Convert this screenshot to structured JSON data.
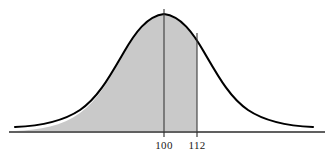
{
  "figure": {
    "type": "normal-distribution-curve",
    "background_color": "#ffffff",
    "curve_color": "#000000",
    "shade_color": "#c9c9c9",
    "axis_color": "#2b2b2b",
    "marker_line_color": "#3a3a3a"
  },
  "axis": {
    "baseline_y": 132,
    "x_start": 9,
    "x_end": 325
  },
  "markers": [
    {
      "id": "mean-marker",
      "label": "100",
      "x": 164,
      "label_x": 164,
      "label_y": 139,
      "line_top_y": 9,
      "tick_bottom_y": 137
    },
    {
      "id": "value-marker",
      "label": "112",
      "x": 197,
      "label_x": 197,
      "label_y": 139,
      "line_top_y": 33,
      "tick_bottom_y": 137
    }
  ],
  "chart_data": {
    "type": "area",
    "title": "",
    "subtitle": "",
    "xlabel": "",
    "ylabel": "",
    "grid": false,
    "legend": null,
    "distribution": "normal",
    "mean": 100,
    "std_dev": 12,
    "tick_labels": [
      "100",
      "112"
    ],
    "tick_values": [
      100,
      112
    ],
    "shaded_region": {
      "from": "-infinity",
      "to": 112,
      "fill": "#c9c9c9",
      "description": "Area under the normal curve to the left of 112"
    },
    "vertical_lines": [
      100,
      112
    ],
    "x_pixel_of_mean": 164,
    "x_pixel_per_unit": 2.75,
    "curve_peak_pixel": {
      "x": 164,
      "y": 14
    },
    "curve_extent_pixels": {
      "left": 15,
      "right": 313
    },
    "series": [
      {
        "name": "normal density",
        "x": [
          60,
          64,
          68,
          72,
          76,
          80,
          84,
          88,
          92,
          96,
          100,
          104,
          108,
          112,
          116,
          120,
          124,
          128,
          132,
          136,
          140
        ],
        "values": [
          0.0005,
          0.0014,
          0.0036,
          0.0082,
          0.0166,
          0.0301,
          0.0487,
          0.0704,
          0.0911,
          0.1056,
          0.1095,
          0.1056,
          0.0911,
          0.0704,
          0.0487,
          0.0301,
          0.0166,
          0.0082,
          0.0036,
          0.0014,
          0.0005
        ]
      }
    ]
  }
}
